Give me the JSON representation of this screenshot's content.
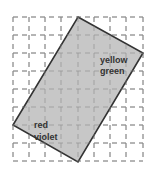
{
  "diagram": {
    "width": 152,
    "height": 175,
    "grid": {
      "x_lines": [
        13,
        29,
        45,
        61,
        78,
        94,
        110,
        126,
        143
      ],
      "y_lines": [
        17,
        35,
        53,
        71,
        89,
        107,
        125,
        143,
        161
      ],
      "line_color": "#8a8a8a",
      "dash": "5,4"
    },
    "rectangle": {
      "points": "78,17 143,53 78,162 13,125",
      "fill": "#c4c4c4",
      "stroke": "#333333"
    },
    "labels": {
      "top_right_line1": "yellow",
      "top_right_line2": "green",
      "bottom_left_line1": "red",
      "bottom_left_line2": "violet"
    }
  }
}
